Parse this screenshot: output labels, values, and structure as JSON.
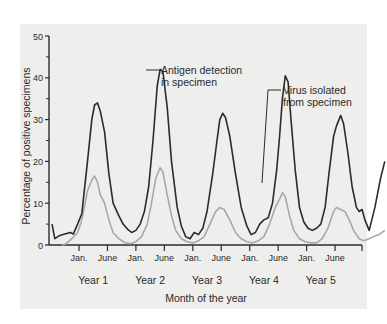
{
  "chart_data": {
    "type": "line",
    "title": "",
    "xlabel": "Month of the year",
    "ylabel": "Percentage of positive specimens",
    "ylim": [
      0,
      50
    ],
    "yticks": [
      0,
      10,
      20,
      30,
      40,
      50
    ],
    "y_minor_ticks": [
      5,
      15,
      25,
      35,
      45
    ],
    "x_tick_labels": [
      "Jan.",
      "June",
      "Jan.",
      "June",
      "Jan.",
      "June",
      "Jan.",
      "June",
      "Jan.",
      "June"
    ],
    "x_tick_positions": [
      1,
      2,
      3,
      4,
      5,
      6,
      7,
      8,
      9,
      10
    ],
    "xlim": [
      -0.05,
      11
    ],
    "year_labels": [
      "Year 1",
      "Year 2",
      "Year 3",
      "Year 4",
      "Year 5"
    ],
    "year_label_positions": [
      1.5,
      3.5,
      5.5,
      7.5,
      9.5
    ],
    "grid": false,
    "legend_position": "inline annotations",
    "series": [
      {
        "name": "Antigen detection in specimen",
        "color": "#2b2b2b",
        "points": [
          [
            0.05,
            5
          ],
          [
            0.15,
            1.5
          ],
          [
            0.3,
            2.2
          ],
          [
            0.5,
            2.6
          ],
          [
            0.7,
            3
          ],
          [
            0.8,
            2.6
          ],
          [
            0.95,
            5
          ],
          [
            1.1,
            7.5
          ],
          [
            1.3,
            20
          ],
          [
            1.45,
            30
          ],
          [
            1.55,
            33.5
          ],
          [
            1.65,
            34
          ],
          [
            1.75,
            32
          ],
          [
            1.9,
            27
          ],
          [
            2.05,
            17
          ],
          [
            2.2,
            10
          ],
          [
            2.4,
            7
          ],
          [
            2.55,
            5
          ],
          [
            2.7,
            3.8
          ],
          [
            2.85,
            3
          ],
          [
            3.0,
            3.5
          ],
          [
            3.15,
            5
          ],
          [
            3.3,
            8
          ],
          [
            3.45,
            14
          ],
          [
            3.6,
            25
          ],
          [
            3.75,
            38
          ],
          [
            3.85,
            42
          ],
          [
            3.95,
            41.5
          ],
          [
            4.1,
            33
          ],
          [
            4.25,
            20
          ],
          [
            4.45,
            9
          ],
          [
            4.6,
            4.5
          ],
          [
            4.75,
            2
          ],
          [
            4.9,
            1.5
          ],
          [
            5.05,
            3
          ],
          [
            5.2,
            2.5
          ],
          [
            5.35,
            4
          ],
          [
            5.5,
            8
          ],
          [
            5.7,
            17
          ],
          [
            5.85,
            25
          ],
          [
            5.95,
            30
          ],
          [
            6.05,
            31.5
          ],
          [
            6.15,
            30.5
          ],
          [
            6.3,
            26
          ],
          [
            6.5,
            17
          ],
          [
            6.7,
            9
          ],
          [
            6.9,
            4.5
          ],
          [
            7.05,
            2.5
          ],
          [
            7.2,
            3
          ],
          [
            7.35,
            5
          ],
          [
            7.5,
            6
          ],
          [
            7.65,
            6.5
          ],
          [
            7.8,
            10
          ],
          [
            7.95,
            18
          ],
          [
            8.05,
            26
          ],
          [
            8.15,
            35
          ],
          [
            8.25,
            40.5
          ],
          [
            8.35,
            39
          ],
          [
            8.45,
            30
          ],
          [
            8.6,
            18
          ],
          [
            8.75,
            9
          ],
          [
            8.9,
            5.5
          ],
          [
            9.05,
            4
          ],
          [
            9.2,
            3.5
          ],
          [
            9.35,
            4
          ],
          [
            9.5,
            5
          ],
          [
            9.65,
            9
          ],
          [
            9.8,
            18
          ],
          [
            9.95,
            26
          ],
          [
            10.05,
            28.5
          ],
          [
            10.2,
            31
          ],
          [
            10.3,
            29
          ],
          [
            10.45,
            22
          ],
          [
            10.6,
            14
          ],
          [
            10.75,
            9
          ],
          [
            10.85,
            8
          ],
          [
            10.95,
            8.5
          ],
          [
            11.05,
            6
          ],
          [
            11.2,
            3.5
          ],
          [
            11.4,
            9
          ],
          [
            11.6,
            16
          ],
          [
            11.75,
            20
          ]
        ]
      },
      {
        "name": "Virus isolated from specimen",
        "color": "#a8a8a8",
        "points": [
          [
            0.4,
            0
          ],
          [
            0.55,
            0.3
          ],
          [
            0.75,
            1.5
          ],
          [
            0.95,
            3
          ],
          [
            1.1,
            6
          ],
          [
            1.3,
            13
          ],
          [
            1.45,
            15.5
          ],
          [
            1.55,
            16.5
          ],
          [
            1.65,
            15
          ],
          [
            1.75,
            12
          ],
          [
            1.9,
            10
          ],
          [
            2.05,
            6
          ],
          [
            2.2,
            3
          ],
          [
            2.4,
            1.5
          ],
          [
            2.6,
            0.6
          ],
          [
            2.8,
            0.3
          ],
          [
            3.0,
            0.8
          ],
          [
            3.2,
            2
          ],
          [
            3.4,
            5
          ],
          [
            3.55,
            10
          ],
          [
            3.7,
            16
          ],
          [
            3.85,
            18.5
          ],
          [
            3.95,
            17.5
          ],
          [
            4.1,
            12
          ],
          [
            4.25,
            7
          ],
          [
            4.4,
            3.5
          ],
          [
            4.6,
            1.5
          ],
          [
            4.8,
            0.8
          ],
          [
            5.0,
            0.5
          ],
          [
            5.2,
            1
          ],
          [
            5.4,
            2
          ],
          [
            5.6,
            5
          ],
          [
            5.8,
            8
          ],
          [
            5.95,
            9
          ],
          [
            6.1,
            8.5
          ],
          [
            6.3,
            6
          ],
          [
            6.5,
            3
          ],
          [
            6.7,
            1.5
          ],
          [
            6.9,
            0.8
          ],
          [
            7.1,
            0.5
          ],
          [
            7.3,
            1
          ],
          [
            7.5,
            2
          ],
          [
            7.7,
            5
          ],
          [
            7.9,
            9
          ],
          [
            8.05,
            11
          ],
          [
            8.15,
            12.5
          ],
          [
            8.25,
            11.5
          ],
          [
            8.4,
            7
          ],
          [
            8.55,
            3.5
          ],
          [
            8.75,
            1.5
          ],
          [
            8.95,
            0.8
          ],
          [
            9.15,
            0.5
          ],
          [
            9.35,
            0.5
          ],
          [
            9.55,
            1.5
          ],
          [
            9.75,
            4
          ],
          [
            9.95,
            8
          ],
          [
            10.05,
            9
          ],
          [
            10.2,
            8.5
          ],
          [
            10.35,
            8
          ],
          [
            10.5,
            6
          ],
          [
            10.65,
            3.5
          ],
          [
            10.85,
            1.5
          ],
          [
            11.0,
            1
          ],
          [
            11.2,
            1.5
          ],
          [
            11.35,
            2
          ],
          [
            11.55,
            2.5
          ],
          [
            11.75,
            3.5
          ]
        ]
      }
    ],
    "annotations": [
      {
        "text_lines": [
          "Antigen detection",
          "in specimen"
        ],
        "points_to_series": 0
      },
      {
        "text_lines": [
          "Virus isolated",
          "from specimen"
        ],
        "points_to_series": 1
      }
    ]
  },
  "labels": {
    "ylabel": "Percentage of positive specimens",
    "xlabel": "Month of the year",
    "annot_antigen_1": "Antigen detection",
    "annot_antigen_2": "in specimen",
    "annot_virus_1": "Virus isolated",
    "annot_virus_2": "from specimen"
  }
}
